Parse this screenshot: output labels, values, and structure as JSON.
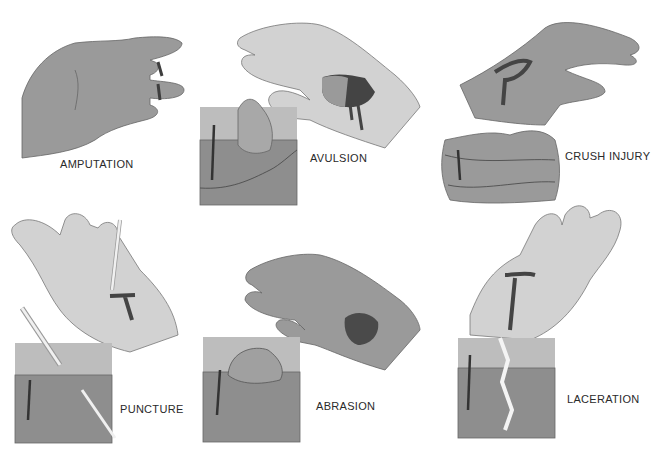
{
  "figure": {
    "panels": [
      {
        "id": "amputation",
        "label": "AMPUTATION"
      },
      {
        "id": "avulsion",
        "label": "AVULSION"
      },
      {
        "id": "crush",
        "label": "CRUSH INJURY"
      },
      {
        "id": "puncture",
        "label": "PUNCTURE"
      },
      {
        "id": "abrasion",
        "label": "ABRASION"
      },
      {
        "id": "laceration",
        "label": "LACERATION"
      }
    ],
    "colors": {
      "background": "#ffffff",
      "hand_dark": "#9a9a9a",
      "hand_light": "#cdcdcd",
      "skin_top": "#bdbdbd",
      "skin_body": "#8e8e8e",
      "wound": "#4a4a4a",
      "outline": "#555555",
      "label": "#2a2a2a"
    }
  }
}
